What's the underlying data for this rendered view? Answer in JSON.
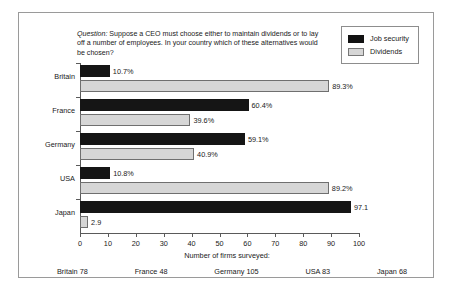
{
  "question": {
    "lead": "Question:",
    "body": " Suppose a CEO must choose either to maintain dividends or to lay off a number of employees. In your country which of these alternatives would be chosen?"
  },
  "legend": {
    "items": [
      {
        "label": "Job security",
        "color": "#151515"
      },
      {
        "label": "Dividends",
        "color": "#d6d6d6"
      }
    ]
  },
  "axis": {
    "caption": "Number of firms surveyed:",
    "ticks": [
      "0",
      "10",
      "20",
      "30",
      "40",
      "50",
      "60",
      "70",
      "80",
      "90",
      "100"
    ]
  },
  "firms_surveyed": [
    {
      "label": "Britain 78"
    },
    {
      "label": "France 48"
    },
    {
      "label": "Germany 105"
    },
    {
      "label": "USA 83"
    },
    {
      "label": "Japan 68"
    }
  ],
  "rows": [
    {
      "country": "Britain",
      "job": {
        "value": 10.7,
        "label": "10.7%"
      },
      "div": {
        "value": 89.3,
        "label": "89.3%"
      }
    },
    {
      "country": "France",
      "job": {
        "value": 60.4,
        "label": "60.4%"
      },
      "div": {
        "value": 39.6,
        "label": "39.6%"
      }
    },
    {
      "country": "Germany",
      "job": {
        "value": 59.1,
        "label": "59.1%"
      },
      "div": {
        "value": 40.9,
        "label": "40.9%"
      }
    },
    {
      "country": "USA",
      "job": {
        "value": 10.8,
        "label": "10.8%"
      },
      "div": {
        "value": 89.2,
        "label": "89.2%"
      }
    },
    {
      "country": "Japan",
      "job": {
        "value": 97.1,
        "label": "97.1"
      },
      "div": {
        "value": 2.9,
        "label": "2.9"
      }
    }
  ],
  "chart_data": {
    "type": "bar",
    "orientation": "horizontal",
    "title": "Question: Suppose a CEO must choose either to maintain dividends or to lay off a number of employees. In your country which of these alternatives would be chosen?",
    "categories": [
      "Britain",
      "France",
      "Germany",
      "USA",
      "Japan"
    ],
    "series": [
      {
        "name": "Job security",
        "values": [
          10.7,
          60.4,
          59.1,
          10.8,
          97.1
        ],
        "color": "#151515"
      },
      {
        "name": "Dividends",
        "values": [
          89.3,
          39.6,
          40.9,
          89.2,
          2.9
        ],
        "color": "#d6d6d6"
      }
    ],
    "data_labels": [
      [
        "10.7%",
        "60.4%",
        "59.1%",
        "10.8%",
        "97.1"
      ],
      [
        "89.3%",
        "39.6%",
        "40.9%",
        "89.2%",
        "2.9"
      ]
    ],
    "xlabel": "",
    "ylabel": "",
    "xlim": [
      0,
      100
    ],
    "xticks": [
      0,
      10,
      20,
      30,
      40,
      50,
      60,
      70,
      80,
      90,
      100
    ],
    "grid": false,
    "legend_position": "top-right",
    "footnote": "Number of firms surveyed:",
    "footnote_values": [
      {
        "country": "Britain",
        "firms": 78
      },
      {
        "country": "France",
        "firms": 48
      },
      {
        "country": "Germany",
        "firms": 105
      },
      {
        "country": "USA",
        "firms": 83
      },
      {
        "country": "Japan",
        "firms": 68
      }
    ]
  }
}
